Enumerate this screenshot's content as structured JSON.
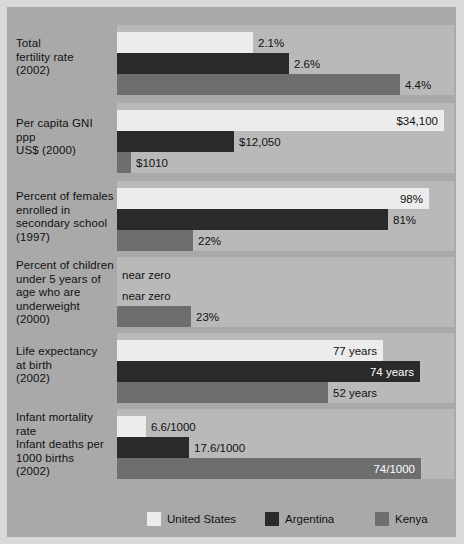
{
  "chart_data": {
    "type": "bar",
    "orientation": "horizontal",
    "title": "",
    "xlabel": "",
    "ylabel": "",
    "grid": false,
    "legend_position": "bottom",
    "legend": [
      "United States",
      "Argentina",
      "Kenya"
    ],
    "series_colors": {
      "United States": "#ececec",
      "Argentina": "#2a2a2a",
      "Kenya": "#6e6e6e"
    },
    "background_color": "#a9a9a9",
    "panel_color": "#b9b9b9",
    "categories": [
      "Total fertility rate (2002)",
      "Per capita GNI ppp US$ (2000)",
      "Percent of females enrolled in secondary school (1997)",
      "Percent of children under 5 years of age who are underweight (2000)",
      "Life expectancy at birth (2002)",
      "Infant mortality rate Infant deaths per 1000 births (2002)"
    ],
    "series": [
      {
        "name": "United States",
        "values": [
          2.1,
          34100,
          98,
          0,
          77,
          6.6
        ],
        "labels": [
          "2.1%",
          "$34,100",
          "98%",
          "near zero",
          "77 years",
          "6.6/1000"
        ]
      },
      {
        "name": "Argentina",
        "values": [
          2.6,
          12050,
          81,
          0,
          74,
          17.6
        ],
        "labels": [
          "2.6%",
          "$12,050",
          "81%",
          "near zero",
          "74 years",
          "17.6/1000"
        ]
      },
      {
        "name": "Kenya",
        "values": [
          4.4,
          1010,
          22,
          23,
          52,
          74
        ],
        "labels": [
          "4.4%",
          "$1010",
          "22%",
          "23%",
          "52 years",
          "74/1000"
        ]
      }
    ]
  },
  "groups": [
    {
      "label_lines": [
        "Total",
        "fertility rate",
        "(2002)"
      ],
      "label_top": 30,
      "panel_top": 18,
      "panel_height": 70,
      "bars": [
        {
          "series": "United States",
          "cls": "us",
          "width": 136,
          "label": "2.1%",
          "label_pos": "outside"
        },
        {
          "series": "Argentina",
          "cls": "ar",
          "width": 172,
          "label": "2.6%",
          "label_pos": "outside"
        },
        {
          "series": "Kenya",
          "cls": "ke",
          "width": 283,
          "label": "4.4%",
          "label_pos": "outside"
        }
      ]
    },
    {
      "label_lines": [
        "Per capita GNI",
        "ppp",
        "US$ (2000)"
      ],
      "label_top": 110,
      "panel_top": 96,
      "panel_height": 70,
      "bars": [
        {
          "series": "United States",
          "cls": "us",
          "width": 327,
          "label": "$34,100",
          "label_pos": "inside-light"
        },
        {
          "series": "Argentina",
          "cls": "ar",
          "width": 117,
          "label": "$12,050",
          "label_pos": "outside"
        },
        {
          "series": "Kenya",
          "cls": "ke",
          "width": 14,
          "label": "$1010",
          "label_pos": "outside"
        }
      ]
    },
    {
      "label_lines": [
        "Percent of females",
        "enrolled in",
        "secondary school",
        "(1997)"
      ],
      "label_top": 183,
      "panel_top": 174,
      "panel_height": 70,
      "bars": [
        {
          "series": "United States",
          "cls": "us",
          "width": 312,
          "label": "98%",
          "label_pos": "inside-light"
        },
        {
          "series": "Argentina",
          "cls": "ar",
          "width": 271,
          "label": "81%",
          "label_pos": "outside"
        },
        {
          "series": "Kenya",
          "cls": "ke",
          "width": 76,
          "label": "22%",
          "label_pos": "outside"
        }
      ]
    },
    {
      "label_lines": [
        "Percent of children",
        "under 5 years of",
        "age who are",
        "underweight",
        "(2000)"
      ],
      "label_top": 252,
      "panel_top": 250,
      "panel_height": 70,
      "bars": [
        {
          "series": "United States",
          "cls": "us",
          "width": 0,
          "label": "near zero",
          "label_pos": "nobar"
        },
        {
          "series": "Argentina",
          "cls": "ar",
          "width": 0,
          "label": "near zero",
          "label_pos": "nobar"
        },
        {
          "series": "Kenya",
          "cls": "ke",
          "width": 74,
          "label": "23%",
          "label_pos": "outside"
        }
      ]
    },
    {
      "label_lines": [
        "Life expectancy",
        "at birth",
        "(2002)"
      ],
      "label_top": 338,
      "panel_top": 326,
      "panel_height": 70,
      "bars": [
        {
          "series": "United States",
          "cls": "us",
          "width": 266,
          "label": "77 years",
          "label_pos": "inside-light"
        },
        {
          "series": "Argentina",
          "cls": "ar",
          "width": 303,
          "label": "74 years",
          "label_pos": "inside"
        },
        {
          "series": "Kenya",
          "cls": "ke",
          "width": 211,
          "label": "52 years",
          "label_pos": "outside"
        }
      ]
    },
    {
      "label_lines": [
        "Infant mortality",
        "rate",
        "Infant deaths per",
        "1000 births",
        "(2002)"
      ],
      "label_top": 404,
      "panel_top": 402,
      "panel_height": 70,
      "bars": [
        {
          "series": "United States",
          "cls": "us",
          "width": 29,
          "label": "6.6/1000",
          "label_pos": "outside"
        },
        {
          "series": "Argentina",
          "cls": "ar",
          "width": 72,
          "label": "17.6/1000",
          "label_pos": "outside"
        },
        {
          "series": "Kenya",
          "cls": "ke",
          "width": 304,
          "label": "74/1000",
          "label_pos": "inside"
        }
      ]
    }
  ],
  "legend": {
    "top": 500,
    "items": [
      {
        "label": "United States",
        "cls": "us",
        "left": 30
      },
      {
        "label": "Argentina",
        "cls": "ar",
        "left": 148
      },
      {
        "label": "Kenya",
        "cls": "ke",
        "left": 258
      }
    ]
  }
}
